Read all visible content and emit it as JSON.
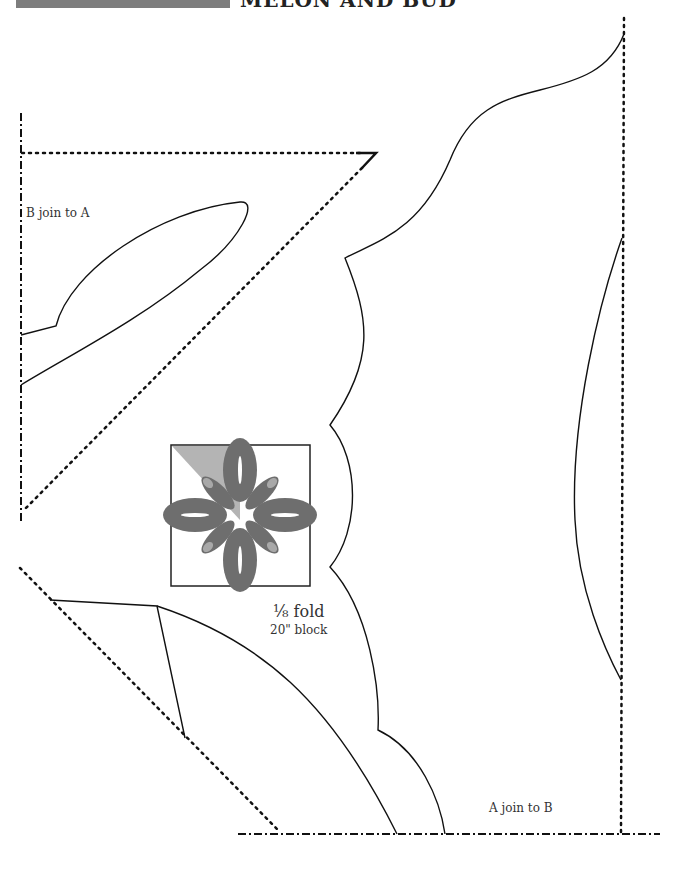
{
  "header": {
    "title": "MELON AND BUD",
    "bar_color": "#7d7d7d"
  },
  "labels": {
    "b_join": "B join to A",
    "a_join": "A join to B",
    "fold": "⅛ fold",
    "block": "20\" block"
  },
  "thumbnail": {
    "design_color": "#6e6e6e",
    "highlight_color": "#b4b4b4",
    "bud_color": "#a8a8a8"
  },
  "line_styles": {
    "cut_line": "solid",
    "fold_line": "dotted",
    "join_line": "dash-dot"
  }
}
